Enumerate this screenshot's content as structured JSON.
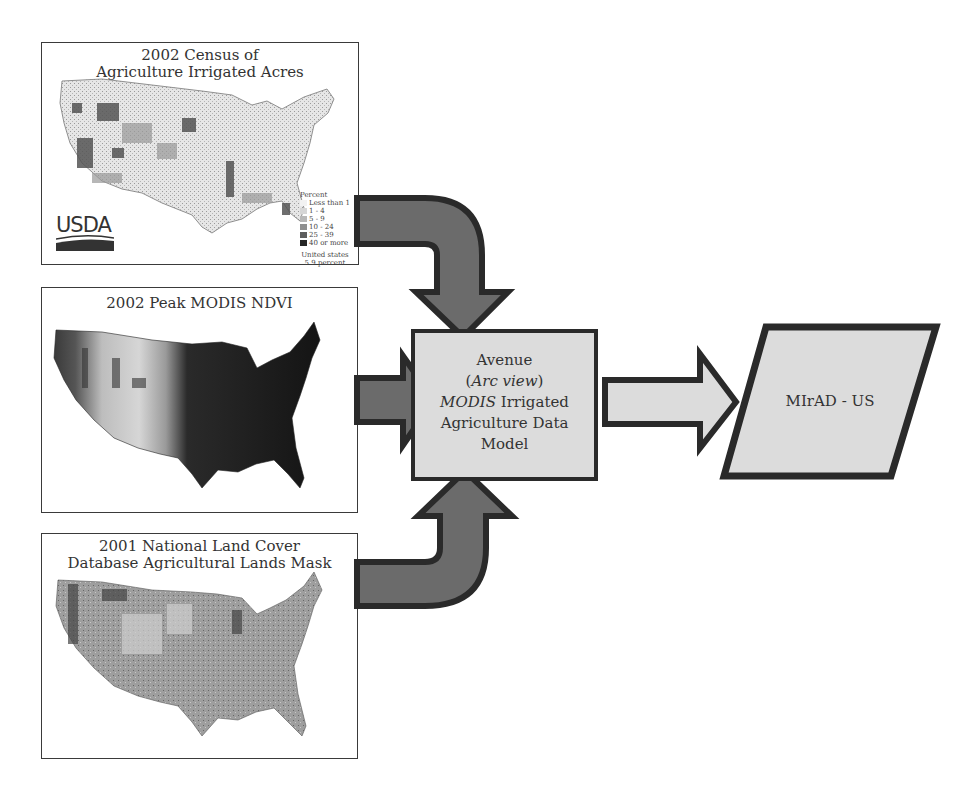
{
  "panels": [
    {
      "id": "census",
      "title_line1": "2002 Census of",
      "title_line2": "Agriculture Irrigated Acres",
      "logo": "USDA",
      "legend": {
        "heading": "Percent",
        "items": [
          {
            "label": "Less than 1",
            "color": "#f2f2f2"
          },
          {
            "label": "1 - 4",
            "color": "#d6d6d6"
          },
          {
            "label": "5 - 9",
            "color": "#b8b8b8"
          },
          {
            "label": "10 - 24",
            "color": "#8f8f8f"
          },
          {
            "label": "25 - 39",
            "color": "#5e5e5e"
          },
          {
            "label": "40 or more",
            "color": "#262626"
          }
        ],
        "footer_line1": "United states",
        "footer_line2": "5.9 percent"
      }
    },
    {
      "id": "ndvi",
      "title_line1": "2002 Peak MODIS NDVI"
    },
    {
      "id": "nlcd",
      "title_line1": "2001 National Land Cover",
      "title_line2": "Database Agricultural Lands Mask"
    }
  ],
  "model": {
    "line1": "Avenue",
    "line2_open": "(",
    "line2_italic": "Arc view",
    "line2_close": ")",
    "line3_italic": "MODIS",
    "line3_rest": " Irrigated",
    "line4": "Agriculture Data",
    "line5": "Model"
  },
  "output": {
    "label": "MIrAD - US"
  },
  "colors": {
    "arrow_dark_fill": "#6b6b6b",
    "arrow_light_fill": "#dcdcdc",
    "stroke": "#2a2a2a",
    "box_fill": "#dcdcdc"
  }
}
